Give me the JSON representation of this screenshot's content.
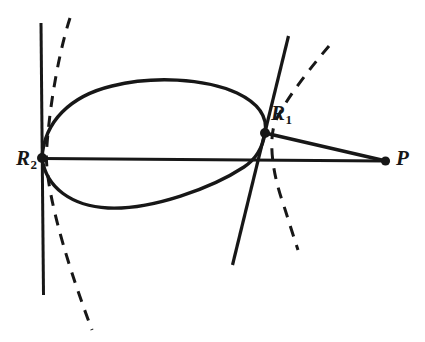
{
  "figure": {
    "kind": "geometry-diagram",
    "title": "",
    "canvas": {
      "width": 425,
      "height": 342,
      "background": "#ffffff"
    },
    "stroke_color": "#171717",
    "labels": [
      {
        "id": "R1",
        "base": "R",
        "subscript": "1",
        "text": "R₁",
        "x": 271,
        "y": 103
      },
      {
        "id": "R2",
        "base": "R",
        "subscript": "2",
        "text": "R₂",
        "x": 16,
        "y": 148
      },
      {
        "id": "P",
        "base": "P",
        "subscript": "",
        "text": "P",
        "x": 396,
        "y": 148
      }
    ],
    "points": [
      {
        "id": "R2",
        "x": 42,
        "y": 158,
        "radius": 5.0
      },
      {
        "id": "R1",
        "x": 265,
        "y": 133,
        "radius": 5.0
      },
      {
        "id": "P",
        "x": 385,
        "y": 161,
        "radius": 4.6
      }
    ],
    "segments": [
      {
        "id": "axis-R2-to-P",
        "from": "R2",
        "to": "P",
        "style": "solid",
        "x1": 42,
        "y1": 158,
        "x2": 386,
        "y2": 161
      },
      {
        "id": "chord-R1-to-P",
        "from": "R1",
        "to": "P",
        "style": "solid",
        "x1": 265,
        "y1": 133,
        "x2": 386,
        "y2": 161
      },
      {
        "id": "tangent-left",
        "style": "solid",
        "x1": 41,
        "y1": 23,
        "x2": 43,
        "y2": 295
      },
      {
        "id": "tangent-right",
        "style": "solid",
        "x1": 288,
        "y1": 36,
        "x2": 233,
        "y2": 265
      }
    ],
    "curves": [
      {
        "id": "oval-upper-arc",
        "style": "solid",
        "description": "upper arc of closed oval from R2 to R1"
      },
      {
        "id": "oval-lower-arc",
        "style": "solid",
        "description": "lower arc of closed oval from R2 to R1"
      },
      {
        "id": "dashed-left",
        "style": "dashed",
        "description": "dashed curve through R2 region"
      },
      {
        "id": "dashed-right",
        "style": "dashed",
        "description": "dashed curve through R1 region"
      }
    ],
    "line_widths": {
      "solid": 3.0,
      "dashed": 3.0
    },
    "dash_pattern": "11 9"
  }
}
